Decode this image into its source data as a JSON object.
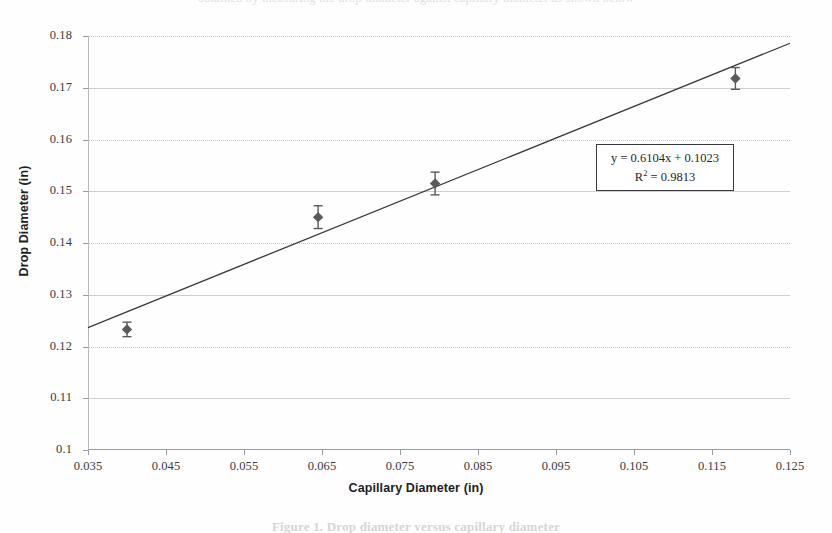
{
  "page": {
    "cut_top_text": "obtained by measuring the drop diameter against capillary diameter as shown below",
    "cut_bottom_text": "Figure 1. Drop diameter versus capillary diameter"
  },
  "chart_data": {
    "type": "scatter",
    "title": "",
    "xlabel": "Capillary Diameter (in)",
    "ylabel": "Drop Diameter (in)",
    "xlim": [
      0.035,
      0.125
    ],
    "ylim": [
      0.1,
      0.18
    ],
    "xticks": [
      "0.035",
      "0.045",
      "0.055",
      "0.065",
      "0.075",
      "0.085",
      "0.095",
      "0.105",
      "0.115",
      "0.125"
    ],
    "xtick_values": [
      0.035,
      0.045,
      0.055,
      0.065,
      0.075,
      0.085,
      0.095,
      0.105,
      0.115,
      0.125
    ],
    "yticks": [
      "0.1",
      "0.11",
      "0.12",
      "0.13",
      "0.14",
      "0.15",
      "0.16",
      "0.17",
      "0.18"
    ],
    "ytick_values": [
      0.1,
      0.11,
      0.12,
      0.13,
      0.14,
      0.15,
      0.16,
      0.17,
      0.18
    ],
    "grid": true,
    "legend": "none",
    "series": [
      {
        "name": "Measured drop diameter",
        "marker": "diamond",
        "color": "#5a5a5e",
        "x": [
          0.04,
          0.0645,
          0.0795,
          0.118
        ],
        "y": [
          0.1233,
          0.145,
          0.1515,
          0.1718
        ],
        "yerr": [
          0.0014,
          0.0022,
          0.0022,
          0.0021
        ]
      }
    ],
    "trendline": {
      "type": "linear",
      "slope": 0.6104,
      "intercept": 0.1023,
      "r2": 0.9813,
      "color": "#3a3a3e",
      "style": "solid-thin"
    },
    "annotation": {
      "equation": "y = 0.6104x + 0.1023",
      "r_squared_prefix": "R",
      "r_squared_sup": "2",
      "r_squared_value": " = 0.9813",
      "box_border_color": "#3a3a3e"
    }
  }
}
